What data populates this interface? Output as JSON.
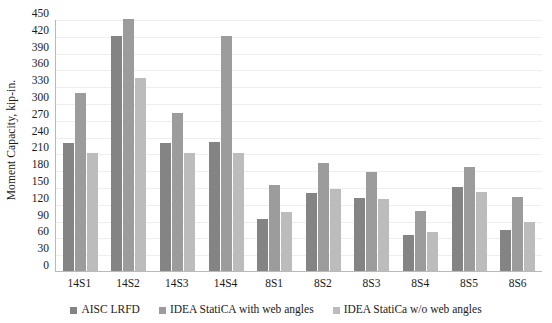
{
  "chart_data": {
    "type": "bar",
    "title": "",
    "xlabel": "",
    "ylabel": "Moment Capacity, kip-in.",
    "ylim": [
      0,
      450
    ],
    "ytick_step": 30,
    "yticks": [
      0,
      30,
      60,
      90,
      120,
      150,
      180,
      210,
      240,
      270,
      300,
      330,
      360,
      390,
      420,
      450
    ],
    "ytick_labels": [
      "0",
      "30",
      "60",
      "90",
      "120",
      "150",
      "180",
      "210",
      "240",
      "270",
      "300",
      "330",
      "360",
      "390",
      "420",
      "450"
    ],
    "grid": true,
    "legend_position": "bottom",
    "categories": [
      "14S1",
      "14S2",
      "14S3",
      "14S4",
      "8S1",
      "8S2",
      "8S3",
      "8S4",
      "8S5",
      "8S6"
    ],
    "series": [
      {
        "name": "AISC LRFD",
        "color": "#848484",
        "values": [
          228,
          420,
          228,
          230,
          93,
          140,
          130,
          64,
          150,
          73
        ]
      },
      {
        "name": "IDEA StatiCA with web angles",
        "color": "#9c9c9c",
        "values": [
          318,
          450,
          282,
          420,
          153,
          192,
          177,
          108,
          186,
          133
        ]
      },
      {
        "name": "IDEA StatiCa w/o web angles",
        "color": "#bcbcbc",
        "values": [
          210,
          345,
          210,
          210,
          105,
          147,
          128,
          70,
          141,
          88
        ]
      }
    ]
  },
  "legend": {
    "items": [
      {
        "label": "AISC LRFD",
        "color": "#848484"
      },
      {
        "label": "IDEA StatiCA with web angles",
        "color": "#9c9c9c"
      },
      {
        "label": "IDEA StatiCa w/o web angles",
        "color": "#bcbcbc"
      }
    ]
  }
}
